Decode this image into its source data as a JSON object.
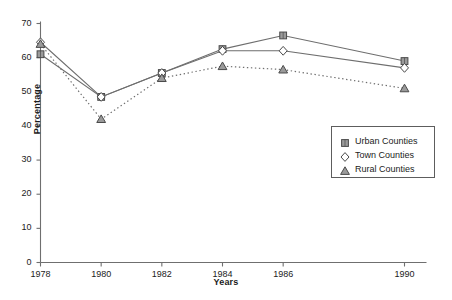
{
  "chart_data": {
    "type": "line",
    "title": "",
    "xlabel": "Years",
    "ylabel": "Percentage",
    "x": [
      1978,
      1980,
      1982,
      1984,
      1986,
      1990
    ],
    "categories": [
      "1978",
      "1980",
      "1982",
      "1984",
      "1986",
      "1990"
    ],
    "xlim": [
      1978,
      1990
    ],
    "ylim": [
      0,
      70
    ],
    "yticks": [
      0,
      10,
      20,
      30,
      40,
      50,
      60,
      70
    ],
    "xticks": [
      "1978",
      "1980",
      "1982",
      "1984",
      "1986",
      "1990"
    ],
    "grid": false,
    "legend_position": "lower-right",
    "series": [
      {
        "name": "Urban Counties",
        "marker": "square",
        "line_style": "solid",
        "color": "#6e6e6e",
        "values": [
          61,
          48.5,
          55.5,
          62.5,
          66.5,
          59
        ]
      },
      {
        "name": "Town Counties",
        "marker": "diamond",
        "line_style": "solid",
        "color": "#6e6e6e",
        "values": [
          64.5,
          48.5,
          55.5,
          62,
          62,
          57
        ]
      },
      {
        "name": "Rural Counties",
        "marker": "triangle",
        "line_style": "dotted",
        "color": "#6e6e6e",
        "values": [
          64,
          42,
          54,
          57.5,
          56.5,
          51
        ]
      }
    ]
  },
  "axis": {
    "y_title": "Percentage",
    "x_title": "Years",
    "y_tick_labels": [
      "0",
      "10",
      "20",
      "30",
      "40",
      "50",
      "60",
      "70"
    ],
    "x_tick_labels": [
      "1978",
      "1980",
      "1982",
      "1984",
      "1986",
      "1990"
    ]
  },
  "legend": {
    "items": [
      {
        "label": "Urban Counties",
        "marker": "square-marker"
      },
      {
        "label": "Town Counties",
        "marker": "diamond-marker"
      },
      {
        "label": "Rural Counties",
        "marker": "triangle-marker"
      }
    ]
  },
  "colors": {
    "axis": "#6f6f6f",
    "series": "#6e6e6e",
    "text": "#1b1b1b",
    "legend_border": "#5d5d5d",
    "background": "#ffffff"
  }
}
